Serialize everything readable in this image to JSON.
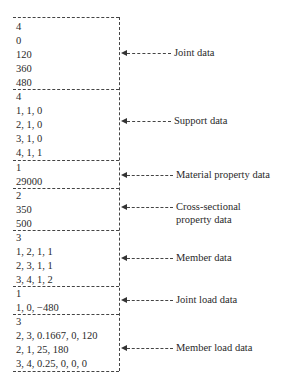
{
  "groups": [
    {
      "name": "joint-data",
      "label": [
        "Joint data"
      ],
      "lines": [
        "4",
        "0",
        "120",
        "360",
        "480"
      ]
    },
    {
      "name": "support-data",
      "label": [
        "Support data"
      ],
      "lines": [
        "4",
        "1, 1, 0",
        "2, 1, 0",
        "3, 1, 0",
        "4, 1, 1"
      ]
    },
    {
      "name": "material-property-data",
      "label": [
        "Material property data"
      ],
      "lines": [
        "1",
        "29000"
      ]
    },
    {
      "name": "cross-sectional-property-data",
      "label": [
        "Cross-sectional",
        "property data"
      ],
      "lines": [
        "2",
        "350",
        "500"
      ]
    },
    {
      "name": "member-data",
      "label": [
        "Member data"
      ],
      "lines": [
        "3",
        "1, 2, 1, 1",
        "2, 3, 1, 1",
        "3, 4, 1, 2"
      ]
    },
    {
      "name": "joint-load-data",
      "label": [
        "Joint load data"
      ],
      "lines": [
        "1",
        "1, 0, −480"
      ]
    },
    {
      "name": "member-load-data",
      "label": [
        "Member load data"
      ],
      "lines": [
        "3",
        "2, 3, 0.1667, 0, 120",
        "2, 1, 25, 180",
        "3, 4, 0.25, 0, 0, 0"
      ]
    }
  ]
}
